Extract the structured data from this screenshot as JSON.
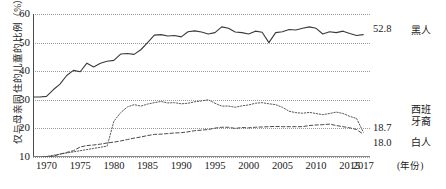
{
  "chart_data": {
    "type": "line",
    "title": "",
    "xlabel": "(年份)",
    "ylabel": "仅与母亲同住的儿童的比例（%）",
    "xlim": [
      1968,
      2018
    ],
    "ylim": [
      10,
      60
    ],
    "ytick_values": [
      60,
      50,
      40,
      30,
      20,
      10
    ],
    "xtick_values": [
      1970,
      1975,
      1980,
      1985,
      1990,
      1995,
      2000,
      2005,
      2010,
      2015,
      2017
    ],
    "grid": true,
    "legend_position": "right",
    "x": [
      1968,
      1969,
      1970,
      1971,
      1972,
      1973,
      1974,
      1975,
      1976,
      1977,
      1978,
      1979,
      1980,
      1981,
      1982,
      1983,
      1984,
      1985,
      1986,
      1987,
      1988,
      1989,
      1990,
      1991,
      1992,
      1993,
      1994,
      1995,
      1996,
      1997,
      1998,
      1999,
      2000,
      2001,
      2002,
      2003,
      2004,
      2005,
      2006,
      2007,
      2008,
      2009,
      2010,
      2011,
      2012,
      2013,
      2014,
      2015,
      2016,
      2017
    ],
    "series": [
      {
        "name": "黑人",
        "style": "solid",
        "color": "#3a3a3a",
        "end_label": "52.8",
        "values": [
          31.0,
          31.0,
          31.2,
          33.5,
          35.5,
          38.5,
          40.3,
          39.8,
          42.8,
          41.5,
          42.8,
          43.5,
          43.8,
          46.0,
          46.2,
          45.9,
          47.5,
          50.0,
          52.6,
          52.8,
          52.3,
          52.5,
          52.0,
          53.8,
          54.1,
          53.7,
          53.0,
          53.5,
          55.5,
          55.0,
          53.7,
          53.5,
          53.0,
          54.0,
          53.6,
          50.0,
          53.5,
          53.8,
          54.6,
          54.4,
          55.0,
          55.5,
          55.0,
          53.0,
          53.8,
          53.5,
          54.0,
          53.2,
          52.5,
          52.8
        ]
      },
      {
        "name": "西班牙裔",
        "style": "dotted",
        "color": "#5a5a5a",
        "end_label": "18.7",
        "values": [
          10.0,
          10.0,
          10.2,
          10.6,
          11.0,
          11.4,
          11.8,
          12.2,
          12.6,
          13.0,
          13.4,
          13.8,
          22.5,
          25.5,
          27.5,
          28.3,
          27.8,
          28.5,
          29.0,
          29.4,
          28.9,
          29.0,
          28.6,
          28.8,
          29.3,
          29.6,
          30.0,
          28.8,
          27.8,
          27.8,
          27.4,
          27.9,
          28.2,
          28.8,
          29.0,
          28.6,
          28.3,
          27.4,
          26.0,
          25.5,
          25.3,
          25.6,
          25.2,
          24.8,
          25.2,
          25.7,
          25.2,
          24.2,
          23.5,
          18.7
        ]
      },
      {
        "name": "白人",
        "style": "dashed",
        "color": "#4a4a4a",
        "end_label": "18.0",
        "values": [
          9.8,
          9.8,
          10.0,
          10.3,
          11.0,
          11.6,
          12.2,
          13.5,
          14.0,
          14.2,
          14.5,
          14.9,
          15.2,
          15.6,
          16.1,
          16.6,
          17.0,
          17.5,
          17.9,
          18.0,
          18.2,
          18.4,
          18.5,
          18.8,
          19.2,
          19.4,
          19.6,
          20.1,
          20.4,
          20.4,
          20.0,
          20.3,
          20.2,
          20.4,
          20.5,
          20.6,
          20.7,
          20.6,
          20.6,
          20.6,
          20.6,
          21.0,
          21.2,
          21.3,
          21.5,
          21.0,
          20.6,
          20.2,
          19.6,
          18.0
        ]
      }
    ]
  },
  "legend": [
    {
      "label": "黑人",
      "lines": [
        "黑人"
      ]
    },
    {
      "label": "西班牙裔",
      "lines": [
        "西班",
        "牙裔"
      ]
    },
    {
      "label": "白人",
      "lines": [
        "白人"
      ]
    }
  ]
}
